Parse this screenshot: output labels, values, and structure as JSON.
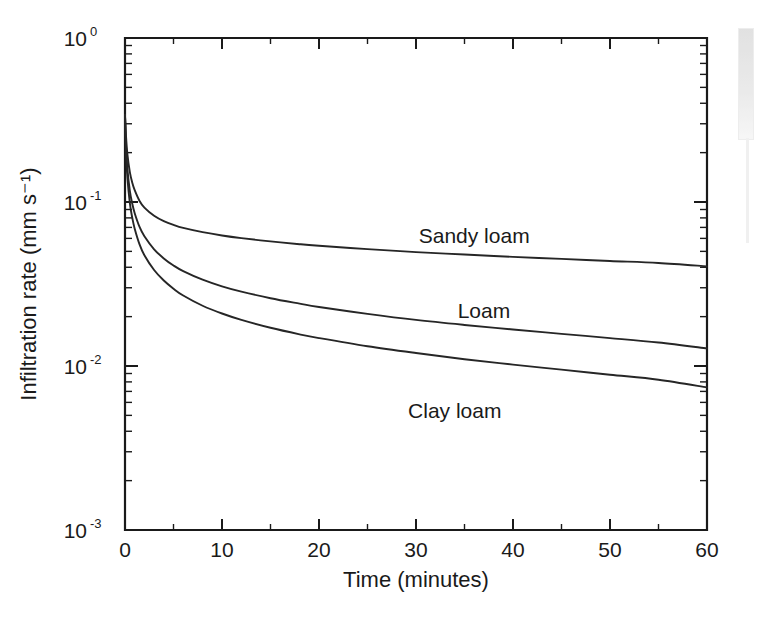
{
  "figure": {
    "background_color": "#ffffff",
    "line_color": "#262626",
    "axis_color": "#1a1a1a"
  },
  "scrollbar": {
    "name": "page-scrollbar",
    "present": true
  },
  "chart_data": {
    "type": "line",
    "title": "",
    "xlabel": "Time (minutes)",
    "ylabel": "Infiltration rate (mm s⁻¹)",
    "xlim": [
      0,
      60
    ],
    "ylim": [
      0.001,
      1
    ],
    "yscale": "log",
    "xscale": "linear",
    "grid": false,
    "legend": "inline-labels",
    "x_ticks": [
      0,
      10,
      20,
      30,
      40,
      50,
      60
    ],
    "x_tick_labels": [
      "0",
      "10",
      "20",
      "30",
      "40",
      "50",
      "60"
    ],
    "x_minor_ticks": [
      5,
      15,
      25,
      35,
      45,
      55
    ],
    "y_ticks": [
      1,
      0.1,
      0.01,
      0.001
    ],
    "y_tick_labels": [
      "10⁰",
      "10⁻¹",
      "10⁻²",
      "10⁻³"
    ],
    "y_tick_mantissas": [
      "10",
      "10",
      "10",
      "10"
    ],
    "y_tick_exponents": [
      "0",
      "-1",
      "-2",
      "-3"
    ],
    "x": [
      0,
      0.1,
      0.25,
      0.5,
      0.75,
      1,
      1.5,
      2,
      3,
      4,
      5,
      6,
      8,
      10,
      12,
      15,
      18,
      20,
      25,
      30,
      35,
      40,
      45,
      50,
      55,
      60
    ],
    "series": [
      {
        "name": "Sandy loam",
        "label": "Sandy loam",
        "label_x": 36,
        "label_y": 0.062,
        "final_value": 0.04,
        "initial_value": 0.34,
        "values": [
          0.34,
          0.255,
          0.195,
          0.152,
          0.131,
          0.118,
          0.1015,
          0.0925,
          0.0825,
          0.0765,
          0.0725,
          0.0695,
          0.0655,
          0.0625,
          0.0602,
          0.0575,
          0.0553,
          0.0541,
          0.0516,
          0.0495,
          0.0478,
          0.0463,
          0.045,
          0.0437,
          0.0425,
          0.0405
        ]
      },
      {
        "name": "Loam",
        "label": "Loam",
        "label_x": 37,
        "label_y": 0.0215,
        "final_value": 0.0128,
        "initial_value": 0.34,
        "values": [
          0.34,
          0.222,
          0.159,
          0.117,
          0.0975,
          0.0855,
          0.0705,
          0.0618,
          0.0515,
          0.0453,
          0.041,
          0.0379,
          0.0336,
          0.0306,
          0.0284,
          0.0259,
          0.024,
          0.0229,
          0.0208,
          0.0191,
          0.0178,
          0.0167,
          0.0157,
          0.0148,
          0.0139,
          0.0128
        ]
      },
      {
        "name": "Clay loam",
        "label": "Clay loam",
        "label_x": 34,
        "label_y": 0.0053,
        "final_value": 0.0074,
        "initial_value": 0.34,
        "values": [
          0.34,
          0.205,
          0.14,
          0.0985,
          0.08,
          0.0688,
          0.0552,
          0.0474,
          0.0385,
          0.0332,
          0.0296,
          0.0269,
          0.0233,
          0.0209,
          0.0191,
          0.0171,
          0.0156,
          0.0148,
          0.0132,
          0.012,
          0.011,
          0.0102,
          0.0095,
          0.00885,
          0.00825,
          0.0074
        ]
      }
    ]
  }
}
